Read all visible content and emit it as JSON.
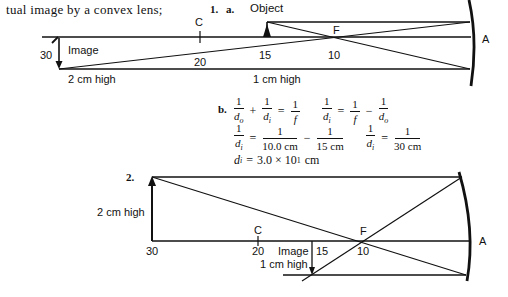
{
  "header_text": "tual image by a convex lens;",
  "problem1": {
    "label": "1.",
    "part_a_label": "a.",
    "object_label": "Object",
    "image_label": "Image",
    "c_label": "C",
    "f_label": "F",
    "a_label": "A",
    "tick_30": "30",
    "tick_20": "20",
    "tick_15": "15",
    "tick_10": "10",
    "image_height": "2 cm high",
    "object_height": "1 cm high"
  },
  "part_b": {
    "label": "b.",
    "eq1": {
      "n1": "1",
      "d1": "d",
      "s1": "o",
      "n2": "1",
      "d2": "d",
      "s2": "i",
      "n3": "1",
      "d3": "f",
      "op1": "+",
      "op2": "="
    },
    "eq2": {
      "n1": "1",
      "d1": "d",
      "s1": "i",
      "n2": "1",
      "d2": "f",
      "n3": "1",
      "d3": "d",
      "s3": "o",
      "op1": "=",
      "op2": "−"
    },
    "eq3": {
      "n1": "1",
      "d1": "d",
      "s1": "i",
      "n2": "1",
      "d2": "10.0 cm",
      "n3": "1",
      "d3": "15 cm",
      "op1": "=",
      "op2": "−"
    },
    "eq4": {
      "n1": "1",
      "d1": "d",
      "s1": "i",
      "n2": "1",
      "d2": "30 cm",
      "op1": "="
    },
    "result": {
      "lhs": "d",
      "sub": "i",
      "eq": "=",
      "value": "3.0 × 10",
      "exp": "1",
      "unit": "cm"
    }
  },
  "problem2": {
    "label": "2.",
    "object_height": "2 cm high",
    "c_label": "C",
    "f_label": "F",
    "a_label": "A",
    "tick_30": "30",
    "tick_20": "20",
    "tick_15": "15",
    "tick_10": "10",
    "image_label": "Image",
    "image_height": "1 cm high"
  }
}
